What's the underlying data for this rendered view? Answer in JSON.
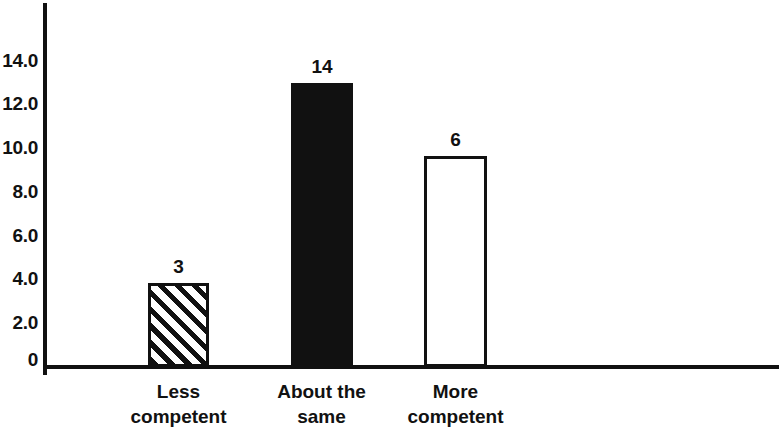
{
  "chart_data": {
    "type": "bar",
    "title": "",
    "subtitle": "",
    "xlabel": "",
    "ylabel": "",
    "categories": [
      "Less\ncompetent",
      "About the\nsame",
      "More\ncompetent"
    ],
    "values": [
      3,
      14,
      6
    ],
    "data_labels": [
      "3",
      "14",
      "6"
    ],
    "bar_styles": [
      "hatched-diagonal",
      "solid-black",
      "white-outline"
    ],
    "ylim": [
      0,
      15.5
    ],
    "yticks": [
      0,
      2,
      4,
      6,
      8,
      10,
      12,
      14
    ],
    "ytick_labels": [
      "0",
      "2.0",
      "4.0",
      "6.0",
      "8.0",
      "10.0",
      "12.0",
      "14.0"
    ],
    "grid": false,
    "legend": null,
    "colors": {
      "axis": "#111111",
      "bar_outline": "#111111",
      "bar_solid_fill": "#111111",
      "bar_empty_fill": "#ffffff",
      "background": "#ffffff"
    }
  },
  "axis": {
    "y_ticks": [
      {
        "label": "14.0",
        "top": 51
      },
      {
        "label": "12.0",
        "top": 94
      },
      {
        "label": "10.0",
        "top": 138
      },
      {
        "label": "8.0",
        "top": 182
      },
      {
        "label": "6.0",
        "top": 226
      },
      {
        "label": "4.0",
        "top": 269
      },
      {
        "label": "2.0",
        "top": 313
      },
      {
        "label": "0",
        "top": 350
      }
    ]
  },
  "bars": [
    {
      "name": "less-competent",
      "label": "3",
      "category": "Less\ncompetent",
      "left": 148,
      "width": 61,
      "top": 283,
      "height": 84,
      "label_left": 148,
      "label_top": 257,
      "cat_left": 113,
      "cat_top": 379,
      "cat_width": 131
    },
    {
      "name": "about-the-same",
      "label": "14",
      "category": "About the\nsame",
      "left": 291,
      "width": 62,
      "top": 83,
      "height": 284,
      "label_left": 291,
      "label_top": 57,
      "cat_left": 256,
      "cat_top": 379,
      "cat_width": 131
    },
    {
      "name": "more-competent",
      "label": "6",
      "category": "More\ncompetent",
      "left": 424,
      "width": 63,
      "top": 156,
      "height": 211,
      "label_left": 424,
      "label_top": 130,
      "cat_left": 390,
      "cat_top": 379,
      "cat_width": 131
    }
  ]
}
